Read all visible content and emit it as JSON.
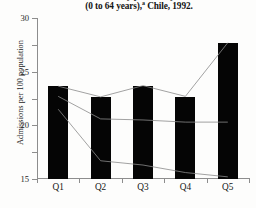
{
  "title": {
    "line1": "admissions ranked by potential years of life lost",
    "line2": "(0 to 64 years),",
    "line2_superscript": "a",
    "line2_rest": " Chile, 1992."
  },
  "axes": {
    "ylabel": "Admissions per 100 population",
    "yticks": [
      "0",
      "5",
      "10",
      "15",
      "20",
      "25",
      "30"
    ],
    "xticklabels": [
      "Q1",
      "Q2",
      "Q3",
      "Q4",
      "Q5"
    ]
  },
  "colors": {
    "bar": "#050505",
    "line": "#8a8a8a",
    "axis": "#8d8d8d",
    "background": "#fdfdfc"
  },
  "chart_data": {
    "type": "bar",
    "xlabel": "",
    "ylabel": "Admissions per 100 population",
    "ylim": [
      0,
      30
    ],
    "ytick_step": 5,
    "grid": false,
    "legend": "none",
    "categories": [
      "Q1",
      "Q2",
      "Q3",
      "Q4",
      "Q5"
    ],
    "values": [
      17.3,
      15.3,
      17.3,
      15.3,
      25.3
    ],
    "series": [
      {
        "name": "bars",
        "type": "bar",
        "values": [
          17.3,
          15.3,
          17.3,
          15.3,
          25.3
        ]
      },
      {
        "name": "line-upper",
        "type": "line",
        "values": [
          17.3,
          15.3,
          17.4,
          15.4,
          25.4
        ]
      },
      {
        "name": "line-middle",
        "type": "line",
        "values": [
          15.4,
          11.2,
          11.0,
          10.6,
          10.6
        ]
      },
      {
        "name": "line-lower",
        "type": "line",
        "values": [
          13.0,
          3.4,
          2.6,
          1.2,
          0.4
        ]
      }
    ]
  }
}
